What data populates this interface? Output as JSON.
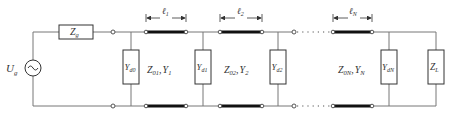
{
  "diagram": {
    "type": "transmission-line-circuit",
    "source": {
      "label": "U",
      "sub": "g"
    },
    "source_impedance": {
      "label": "Z",
      "sub": "g"
    },
    "shunts": [
      {
        "label": "Y",
        "sub": "d0"
      },
      {
        "label": "Y",
        "sub": "d1"
      },
      {
        "label": "Y",
        "sub": "d2"
      },
      {
        "label": "Y",
        "sub": "dN"
      }
    ],
    "lines": [
      {
        "length_label": "ℓ",
        "length_sub": "1",
        "z_label": "Z",
        "z_sub": "01",
        "y_label": "Y",
        "y_sub": "1"
      },
      {
        "length_label": "ℓ",
        "length_sub": "2",
        "z_label": "Z",
        "z_sub": "02",
        "y_label": "Y",
        "y_sub": "2"
      },
      {
        "length_label": "ℓ",
        "length_sub": "N",
        "z_label": "Z",
        "z_sub": "0N",
        "y_label": "Y",
        "y_sub": "N"
      }
    ],
    "load": {
      "label": "Z",
      "sub": "L"
    },
    "separator": ","
  },
  "colors": {
    "wire": "#777777",
    "line": "#111111",
    "text": "#333333"
  }
}
